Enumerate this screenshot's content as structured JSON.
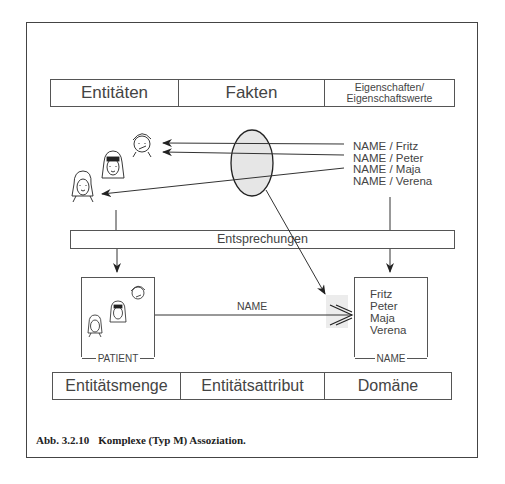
{
  "top_table": {
    "col1": "Entitäten",
    "col2": "Fakten",
    "col3_line1": "Eigenschaften/",
    "col3_line2": "Eigenschaftswerte"
  },
  "facts": [
    "NAME / Fritz",
    "NAME / Peter",
    "NAME / Maja",
    "NAME / Verena"
  ],
  "correspondence_bar": "Entsprechungen",
  "entity_set_box": {
    "label": "PATIENT"
  },
  "association": {
    "label": "NAME"
  },
  "domain_box": {
    "label": "NAME",
    "values": [
      "Fritz",
      "Peter",
      "Maja",
      "Verena"
    ]
  },
  "bottom_table": {
    "col1": "Entitätsmenge",
    "col2": "Entitätsattribut",
    "col3": "Domäne"
  },
  "caption": {
    "number": "Abb. 3.2.10",
    "text": "Komplexe (Typ M) Assoziation."
  },
  "colors": {
    "line": "#333333",
    "ellipse_fill": "#e6e6e6",
    "assoc_highlight": "#ececec"
  }
}
